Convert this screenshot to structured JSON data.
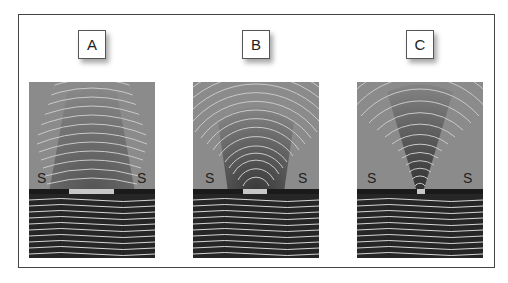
{
  "figure": {
    "panels": [
      {
        "id": "A",
        "label": "A",
        "left_side": "S",
        "right_side": "S",
        "gap_width": "wide"
      },
      {
        "id": "B",
        "label": "B",
        "left_side": "S",
        "right_side": "S",
        "gap_width": "medium"
      },
      {
        "id": "C",
        "label": "C",
        "left_side": "S",
        "right_side": "S",
        "gap_width": "narrow"
      }
    ]
  },
  "colors": {
    "background": "#ffffff",
    "frame": "#444444",
    "panel_upper": "#8a8a8a",
    "panel_lower": "#262626",
    "wave_line": "#d8d8d8",
    "barrier": "#1a1a1a"
  }
}
